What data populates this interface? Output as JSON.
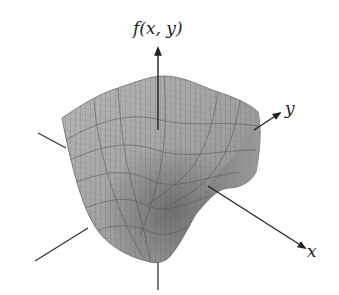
{
  "figure": {
    "type": "3d-surface-plot",
    "axes": {
      "vertical": {
        "label": "f(x, y)"
      },
      "y": {
        "label": "y"
      },
      "x": {
        "label": "x"
      }
    },
    "colors": {
      "surface": "#a9a9a9",
      "surface_dark": "#6e6e6e",
      "mesh": "#5a5a5a",
      "axis": "#333333",
      "background": "#ffffff"
    }
  }
}
